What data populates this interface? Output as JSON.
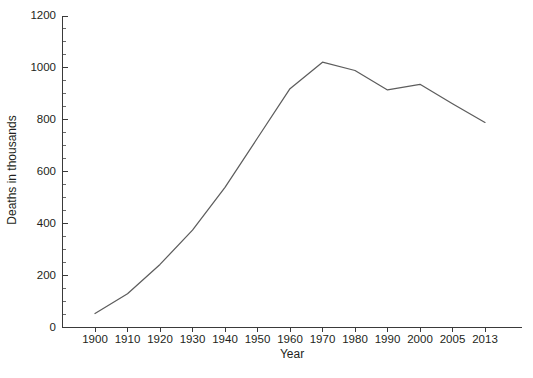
{
  "chart_data": {
    "type": "line",
    "title": "",
    "xlabel": "Year",
    "ylabel": "Deaths in thousands",
    "categories": [
      "1900",
      "1910",
      "1920",
      "1930",
      "1940",
      "1950",
      "1960",
      "1970",
      "1980",
      "1990",
      "2000",
      "2005",
      "2013"
    ],
    "values": [
      54,
      130,
      243,
      375,
      540,
      730,
      920,
      1022,
      990,
      915,
      937,
      862,
      790
    ],
    "series": [
      {
        "name": "Deaths in thousands",
        "values": [
          54,
          130,
          243,
          375,
          540,
          730,
          920,
          1022,
          990,
          915,
          937,
          862,
          790
        ]
      }
    ],
    "ylim": [
      0,
      1200
    ],
    "yticks": [
      0,
      200,
      400,
      600,
      800,
      1000,
      1200
    ],
    "ytick_labels": [
      "0",
      "200",
      "400",
      "600",
      "800",
      "1000",
      "1200"
    ],
    "y_minor_tick_step": 50,
    "grid": false,
    "legend": "none",
    "line_color": "#5d5d5d",
    "axis_color": "#3a3a3a",
    "background_color": "#ffffff"
  }
}
